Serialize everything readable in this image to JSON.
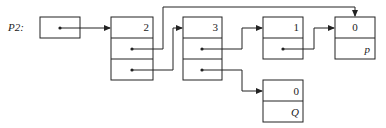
{
  "diagram": {
    "title_label": "P2:",
    "nodes": [
      {
        "id": "head",
        "value": ""
      },
      {
        "id": "n2",
        "value": "2"
      },
      {
        "id": "n3",
        "value": "3"
      },
      {
        "id": "n1",
        "value": "1"
      },
      {
        "id": "np",
        "value": "0",
        "name": "p"
      },
      {
        "id": "nq",
        "value": "0",
        "name": "Q"
      }
    ],
    "edges": [
      {
        "from": "head",
        "to": "n2"
      },
      {
        "from": "n2.field1",
        "to": "np"
      },
      {
        "from": "n2.field2",
        "to": "n3"
      },
      {
        "from": "n3.field1",
        "to": "n1"
      },
      {
        "from": "n3.field2",
        "to": "nq"
      },
      {
        "from": "n1.field1",
        "to": "np"
      }
    ]
  }
}
